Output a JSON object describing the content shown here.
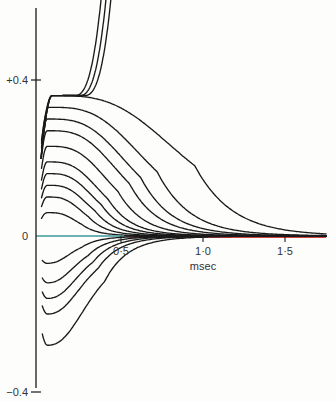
{
  "chart_data": {
    "type": "line",
    "title": "",
    "xlabel": "msec",
    "ylabel": "",
    "xlim": [
      0,
      1.75
    ],
    "ylim": [
      -0.4,
      0.55
    ],
    "grid": false,
    "legend": null,
    "x_ticks": [
      {
        "value": 0.5,
        "label": "0·5"
      },
      {
        "value": 1.0,
        "label": "1·0"
      },
      {
        "value": 1.5,
        "label": "1·5"
      }
    ],
    "y_ticks": [
      {
        "value": 0.4,
        "label": "+0.4"
      },
      {
        "value": 0,
        "label": "0"
      },
      {
        "value": -0.4,
        "label": "−0.4"
      }
    ],
    "colors": {
      "curves": "#1a1a1a",
      "zero_line": "#3a9a9a",
      "baseline_red": "#d04040",
      "axis": "#1a1a1a"
    },
    "series": [
      {
        "name": "runaway-1",
        "kind": "runaway",
        "start": 0.15,
        "converge": 0.36,
        "escape_x": 0.22
      },
      {
        "name": "runaway-2",
        "kind": "runaway",
        "start": 0.15,
        "converge": 0.36,
        "escape_x": 0.25
      },
      {
        "name": "runaway-3",
        "kind": "runaway",
        "start": 0.15,
        "converge": 0.36,
        "escape_x": 0.28
      },
      {
        "name": "pos-1",
        "kind": "hump",
        "peak": 0.36,
        "peak_x": 0.08,
        "decay_x": 0.95
      },
      {
        "name": "pos-2",
        "kind": "hump",
        "peak": 0.33,
        "peak_x": 0.06,
        "decay_x": 0.72
      },
      {
        "name": "pos-3",
        "kind": "hump",
        "peak": 0.3,
        "peak_x": 0.05,
        "decay_x": 0.62
      },
      {
        "name": "pos-4",
        "kind": "hump",
        "peak": 0.27,
        "peak_x": 0.05,
        "decay_x": 0.55
      },
      {
        "name": "pos-5",
        "kind": "hump",
        "peak": 0.23,
        "peak_x": 0.05,
        "decay_x": 0.48
      },
      {
        "name": "pos-6",
        "kind": "hump",
        "peak": 0.19,
        "peak_x": 0.05,
        "decay_x": 0.42
      },
      {
        "name": "pos-7",
        "kind": "hump",
        "peak": 0.16,
        "peak_x": 0.05,
        "decay_x": 0.38
      },
      {
        "name": "pos-8",
        "kind": "hump",
        "peak": 0.13,
        "peak_x": 0.05,
        "decay_x": 0.34
      },
      {
        "name": "pos-9",
        "kind": "hump",
        "peak": 0.1,
        "peak_x": 0.05,
        "decay_x": 0.3
      },
      {
        "name": "pos-10",
        "kind": "hump",
        "peak": 0.06,
        "peak_x": 0.05,
        "decay_x": 0.26
      },
      {
        "name": "zero",
        "kind": "flat",
        "value": 0
      },
      {
        "name": "neg-1",
        "kind": "dip",
        "trough": -0.07,
        "trough_x": 0.05,
        "decay_x": 0.26
      },
      {
        "name": "neg-2",
        "kind": "dip",
        "trough": -0.12,
        "trough_x": 0.05,
        "decay_x": 0.3
      },
      {
        "name": "neg-3",
        "kind": "dip",
        "trough": -0.16,
        "trough_x": 0.05,
        "decay_x": 0.33
      },
      {
        "name": "neg-4",
        "kind": "dip",
        "trough": -0.2,
        "trough_x": 0.05,
        "decay_x": 0.36
      },
      {
        "name": "neg-5",
        "kind": "dip",
        "trough": -0.28,
        "trough_x": 0.05,
        "decay_x": 0.4
      }
    ]
  }
}
